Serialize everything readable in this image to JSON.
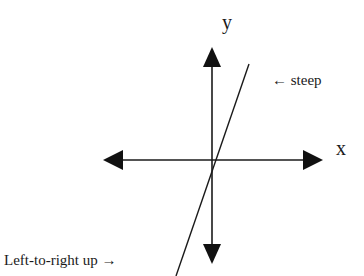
{
  "diagram": {
    "axes": {
      "x_label": "x",
      "y_label": "y",
      "origin": [
        212,
        160
      ],
      "x_range_px": [
        103,
        322
      ],
      "y_range_px": [
        48,
        262
      ],
      "color": "#1a1a1a"
    },
    "line": {
      "description": "steep positive slope line through near origin",
      "from": [
        176,
        276
      ],
      "to": [
        249,
        64
      ],
      "color": "#1a1a1a"
    },
    "annotations": [
      {
        "id": "steep",
        "text": "← steep"
      },
      {
        "id": "left-to-right-up",
        "text": "Left-to-right up →"
      }
    ]
  }
}
